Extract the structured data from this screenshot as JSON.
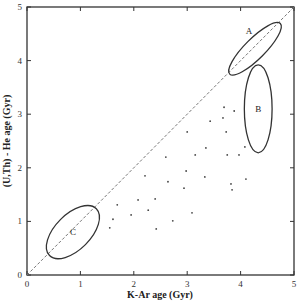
{
  "chart_data": {
    "type": "scatter",
    "title": "",
    "xlabel": "K-Ar  age (Gyr)",
    "ylabel": "(U,Th) - He  age (Gyr)",
    "xlim": [
      0,
      5
    ],
    "ylim": [
      0,
      5
    ],
    "x_ticks": [
      0,
      1,
      2,
      3,
      4,
      5
    ],
    "y_ticks": [
      0,
      1,
      2,
      3,
      4,
      5
    ],
    "x_tick_labels": [
      "0",
      "1",
      "2",
      "3",
      "4",
      "5"
    ],
    "y_tick_labels": [
      "0",
      "1",
      "2",
      "3",
      "4",
      "5"
    ],
    "grid": false,
    "legend": null,
    "reference_line": {
      "label": "1:1",
      "style": "dashed",
      "from": [
        0,
        0
      ],
      "to": [
        5,
        5
      ]
    },
    "series": [
      {
        "name": "samples",
        "marker": "dot",
        "points": [
          [
            3.69,
            3.13
          ],
          [
            3.88,
            3.06
          ],
          [
            3.67,
            2.93
          ],
          [
            3.43,
            2.87
          ],
          [
            3.73,
            2.67
          ],
          [
            3.0,
            2.67
          ],
          [
            2.6,
            2.2
          ],
          [
            3.15,
            2.24
          ],
          [
            3.35,
            2.37
          ],
          [
            3.75,
            2.24
          ],
          [
            3.97,
            2.24
          ],
          [
            4.08,
            2.39
          ],
          [
            2.21,
            1.85
          ],
          [
            2.64,
            1.74
          ],
          [
            2.98,
            1.94
          ],
          [
            3.33,
            1.83
          ],
          [
            2.94,
            1.62
          ],
          [
            3.82,
            1.7
          ],
          [
            3.84,
            1.59
          ],
          [
            4.1,
            1.79
          ],
          [
            2.4,
            1.42
          ],
          [
            2.27,
            1.21
          ],
          [
            3.09,
            1.16
          ],
          [
            1.69,
            1.31
          ],
          [
            2.08,
            1.4
          ],
          [
            1.95,
            1.12
          ],
          [
            1.61,
            1.04
          ],
          [
            1.55,
            0.88
          ],
          [
            2.73,
            1.01
          ],
          [
            2.42,
            0.86
          ]
        ]
      }
    ],
    "regions": [
      {
        "label": "A",
        "center": [
          4.27,
          4.22
        ],
        "semi_major": 0.67,
        "semi_minor": 0.19,
        "rotation_deg": 45
      },
      {
        "label": "B",
        "center": [
          4.33,
          3.1
        ],
        "rx": 0.26,
        "ry": 0.82,
        "rotation_deg": 0
      },
      {
        "label": "C",
        "center": [
          0.86,
          0.8
        ],
        "semi_major": 0.62,
        "semi_minor": 0.33,
        "rotation_deg": 45
      }
    ],
    "annotations": [
      "A",
      "B",
      "C"
    ]
  }
}
